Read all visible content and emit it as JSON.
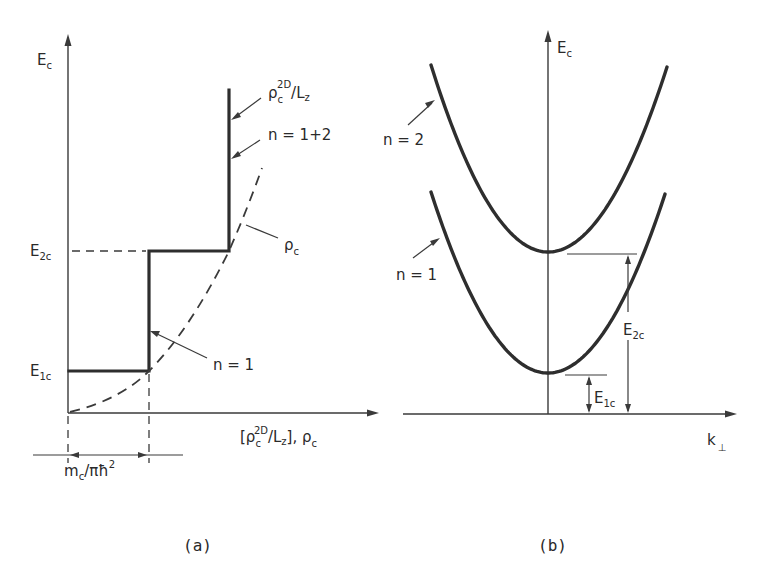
{
  "panel_a": {
    "caption": "(a)",
    "y_axis_label": {
      "main": "E",
      "sub": "c"
    },
    "x_axis_label": {
      "open": "[ρ",
      "sub": "c",
      "sup": "2D",
      "mid": "/L",
      "sub2": "z",
      "close": "], ρ",
      "sub3": "c"
    },
    "levels": [
      {
        "main": "E",
        "sub": "1c"
      },
      {
        "main": "E",
        "sub": "2c"
      }
    ],
    "annotations": {
      "dos_2d": {
        "main": "ρ",
        "sub": "c",
        "sup": "2D",
        "rest": "/L",
        "sub2": "z"
      },
      "n_1_2": "n = 1+2",
      "rho_c": {
        "main": "ρ",
        "sub": "c"
      },
      "n_1": "n = 1"
    },
    "step_width_label": {
      "main": "m",
      "sub": "c",
      "rest": "/πħ",
      "sup": "2"
    },
    "staircase_steps": [
      {
        "n": "1",
        "energy_level": "E1c",
        "dos_multiple": 1
      },
      {
        "n": "1+2",
        "energy_level": "E2c",
        "dos_multiple": 2
      }
    ]
  },
  "panel_b": {
    "caption": "(b)",
    "y_axis_label": {
      "main": "E",
      "sub": "c"
    },
    "x_axis_label": {
      "main": "k",
      "sub": "⊥"
    },
    "subbands": [
      {
        "label": "n = 2",
        "minimum": "E2c"
      },
      {
        "label": "n = 1",
        "minimum": "E1c"
      }
    ],
    "energy_markers": [
      {
        "main": "E",
        "sub": "1c"
      },
      {
        "main": "E",
        "sub": "2c"
      }
    ]
  },
  "colors": {
    "ink": "#2e2e2e",
    "background": "#ffffff"
  }
}
